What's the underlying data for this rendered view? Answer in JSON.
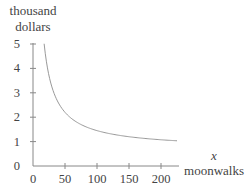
{
  "chart_data": {
    "type": "line",
    "title": "",
    "ylabel": [
      "thousand",
      "dollars"
    ],
    "xlabel": [
      "x",
      "moonwalks"
    ],
    "xlim": [
      0,
      225
    ],
    "ylim": [
      0,
      5
    ],
    "x_ticks": [
      0,
      50,
      100,
      150,
      200
    ],
    "y_ticks": [
      0,
      1,
      2,
      3,
      4,
      5
    ],
    "grid": false,
    "legend": null,
    "series": [
      {
        "name": "cost per moonwalk",
        "x": [
          17.4,
          20,
          25,
          30,
          40,
          50,
          75,
          100,
          125,
          150,
          175,
          200,
          225
        ],
        "values": [
          5.0,
          4.45,
          3.7,
          3.2,
          2.58,
          2.2,
          1.7,
          1.45,
          1.3,
          1.2,
          1.13,
          1.08,
          1.03
        ]
      }
    ],
    "colors": {
      "axis": "#888888",
      "curve": "#999999",
      "text": "#444444"
    }
  }
}
